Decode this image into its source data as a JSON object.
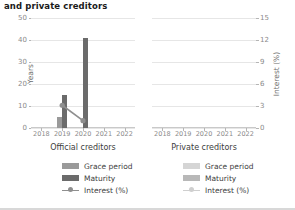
{
  "title": "and private creditors",
  "panels": [
    {
      "id": "official",
      "caption": "Official creditors",
      "legend": [
        {
          "name": "Grace period",
          "type": "bar",
          "color": "#9a9a9a"
        },
        {
          "name": "Maturity",
          "type": "bar",
          "color": "#6b6b6b"
        },
        {
          "name": "Interest (%)",
          "type": "line",
          "color": "#8f8f8f"
        }
      ]
    },
    {
      "id": "private",
      "caption": "Private creditors",
      "legend": [
        {
          "name": "Grace period",
          "type": "bar",
          "color": "#d5d5d5"
        },
        {
          "name": "Maturity",
          "type": "bar",
          "color": "#b8b8b8"
        },
        {
          "name": "Interest (%)",
          "type": "line",
          "color": "#cfcfcf"
        }
      ]
    }
  ],
  "chart_data": {
    "type": "bar",
    "title": "and private creditors",
    "xlabel": "",
    "ylabel": "Years",
    "y2label": "Interest (%)",
    "categories": [
      "2018",
      "2019",
      "2020",
      "2021",
      "2022"
    ],
    "ylim": [
      0,
      50
    ],
    "yticks": [
      0,
      10,
      20,
      30,
      40,
      50
    ],
    "y2lim": [
      0,
      15
    ],
    "y2ticks": [
      0,
      3,
      6,
      9,
      12,
      15
    ],
    "grid": true,
    "legend_position": "below",
    "panels": [
      {
        "name": "Official creditors",
        "series": [
          {
            "name": "Grace period",
            "axis": "left",
            "type": "bar",
            "color": "#9a9a9a",
            "values": [
              null,
              5,
              null,
              null,
              null
            ]
          },
          {
            "name": "Maturity",
            "axis": "left",
            "type": "bar",
            "color": "#6b6b6b",
            "values": [
              null,
              15,
              41,
              null,
              null
            ]
          },
          {
            "name": "Interest (%)",
            "axis": "right",
            "type": "line",
            "color": "#8f8f8f",
            "values": [
              null,
              3.1,
              1.0,
              null,
              null
            ]
          }
        ]
      },
      {
        "name": "Private creditors",
        "series": [
          {
            "name": "Grace period",
            "axis": "left",
            "type": "bar",
            "color": "#d5d5d5",
            "values": [
              null,
              null,
              null,
              null,
              null
            ]
          },
          {
            "name": "Maturity",
            "axis": "left",
            "type": "bar",
            "color": "#b8b8b8",
            "values": [
              null,
              null,
              null,
              null,
              null
            ]
          },
          {
            "name": "Interest (%)",
            "axis": "right",
            "type": "line",
            "color": "#cfcfcf",
            "values": [
              null,
              null,
              null,
              null,
              null
            ]
          }
        ]
      }
    ]
  }
}
